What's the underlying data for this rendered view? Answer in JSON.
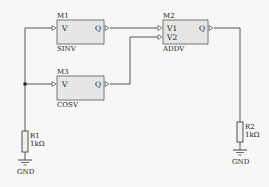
{
  "diagram": {
    "type": "circuit-schematic",
    "modules": [
      {
        "id": "M1",
        "name": "SINV",
        "inputs": [
          "V"
        ],
        "outputs": [
          "Q"
        ]
      },
      {
        "id": "M2",
        "name": "ADDV",
        "inputs": [
          "V1",
          "V2"
        ],
        "outputs": [
          "Q"
        ]
      },
      {
        "id": "M3",
        "name": "COSV",
        "inputs": [
          "V"
        ],
        "outputs": [
          "Q"
        ]
      }
    ],
    "resistors": [
      {
        "id": "R1",
        "value": "1kΩ"
      },
      {
        "id": "R2",
        "value": "1kΩ"
      }
    ],
    "grounds": [
      {
        "label": "GND"
      },
      {
        "label": "GND"
      }
    ],
    "connections": [
      {
        "from": "R1",
        "to": "M1.V"
      },
      {
        "from": "R1",
        "to": "M3.V"
      },
      {
        "from": "M1.Q",
        "to": "M2.V1"
      },
      {
        "from": "M3.Q",
        "to": "M2.V2"
      },
      {
        "from": "M2.Q",
        "to": "R2"
      }
    ]
  }
}
